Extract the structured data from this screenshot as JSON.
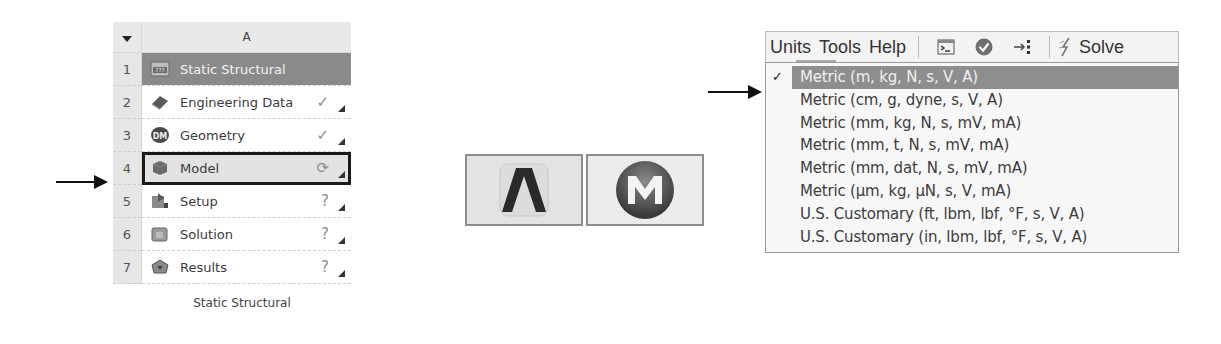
{
  "schematic": {
    "column_header": "A",
    "title_row": {
      "num": "1",
      "label": "Static Structural",
      "icon": "static-structural-icon"
    },
    "rows": [
      {
        "num": "2",
        "label": "Engineering Data",
        "icon": "engineering-data-icon",
        "status": "✓",
        "status_name": "check-icon"
      },
      {
        "num": "3",
        "label": "Geometry",
        "icon": "geometry-dm-icon",
        "status": "✓",
        "status_name": "check-icon"
      },
      {
        "num": "4",
        "label": "Model",
        "icon": "model-icon",
        "status": "⟳",
        "status_name": "refresh-required-icon",
        "selected": true
      },
      {
        "num": "5",
        "label": "Setup",
        "icon": "setup-icon",
        "status": "?",
        "status_name": "question-icon"
      },
      {
        "num": "6",
        "label": "Solution",
        "icon": "solution-icon",
        "status": "?",
        "status_name": "question-icon"
      },
      {
        "num": "7",
        "label": "Results",
        "icon": "results-icon",
        "status": "?",
        "status_name": "question-icon"
      }
    ],
    "caption": "Static Structural"
  },
  "apps": [
    {
      "name": "ansys-logo-button",
      "glyph": "Λ"
    },
    {
      "name": "mechanical-logo-button",
      "glyph": "M"
    }
  ],
  "menu": {
    "bar": [
      "Units",
      "Tools",
      "Help"
    ],
    "solve_label": "Solve",
    "units_options": [
      {
        "label": "Metric (m, kg, N, s, V, A)",
        "checked": true
      },
      {
        "label": "Metric (cm, g, dyne, s, V, A)"
      },
      {
        "label": "Metric (mm, kg, N, s, mV, mA)"
      },
      {
        "label": "Metric (mm, t, N, s, mV, mA)"
      },
      {
        "label": "Metric (mm, dat, N, s, mV, mA)"
      },
      {
        "label": "Metric (µm, kg, µN, s, V, mA)"
      },
      {
        "label": "U.S. Customary (ft, lbm, lbf, °F, s, V, A)"
      },
      {
        "label": "U.S. Customary (in, lbm, lbf, °F, s, V, A)"
      }
    ],
    "check_glyph": "✓"
  },
  "colors": {
    "title_row_bg": "#8a8a8a",
    "selected_row_border": "#1a1a1a",
    "menu_highlight_bg": "#8e8e8e"
  }
}
